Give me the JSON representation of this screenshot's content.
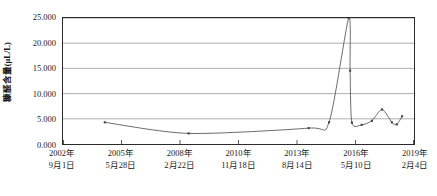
{
  "chart_data": {
    "type": "line",
    "title": "",
    "subtitle": "",
    "xlabel": "",
    "ylabel": "糠醛含量(μL/L)",
    "ylim": [
      0,
      25
    ],
    "ytick_labels": [
      "0.000",
      "5.000",
      "10.000",
      "15.000",
      "20.000",
      "25.000"
    ],
    "ytick_values": [
      0,
      5,
      10,
      15,
      20,
      25
    ],
    "xtick_labels": [
      {
        "line1": "2002年",
        "line2": "9月1日"
      },
      {
        "line1": "2005年",
        "line2": "5月28日"
      },
      {
        "line1": "2008年",
        "line2": "2月22日"
      },
      {
        "line1": "2010年",
        "line2": "11月18日"
      },
      {
        "line1": "2013年",
        "line2": "8月14日"
      },
      {
        "line1": "2016年",
        "line2": "5月10日"
      },
      {
        "line1": "2019年",
        "line2": "2月4日"
      }
    ],
    "xtick_fractions": [
      0.0,
      0.1667,
      0.3333,
      0.5,
      0.6667,
      0.8333,
      1.0
    ],
    "grid": "horizontal",
    "legend": "none",
    "marker": "square",
    "line_color": "#595959",
    "marker_color": "#3f3f3f",
    "grid_color": "#9a9a9a",
    "axis_color": "#2b2b2b",
    "smooth": true,
    "series": [
      {
        "name": "糠醛含量",
        "points": [
          {
            "x": 0.119,
            "y": 4.3
          },
          {
            "x": 0.358,
            "y": 2.1
          },
          {
            "x": 0.7,
            "y": 3.15
          },
          {
            "x": 0.758,
            "y": 4.3
          },
          {
            "x": 0.814,
            "y": 25.0
          },
          {
            "x": 0.818,
            "y": 14.55
          },
          {
            "x": 0.823,
            "y": 4.25
          },
          {
            "x": 0.851,
            "y": 3.8
          },
          {
            "x": 0.88,
            "y": 4.6
          },
          {
            "x": 0.909,
            "y": 6.85
          },
          {
            "x": 0.937,
            "y": 4.3
          },
          {
            "x": 0.951,
            "y": 3.9
          },
          {
            "x": 0.966,
            "y": 5.5
          }
        ]
      }
    ]
  }
}
